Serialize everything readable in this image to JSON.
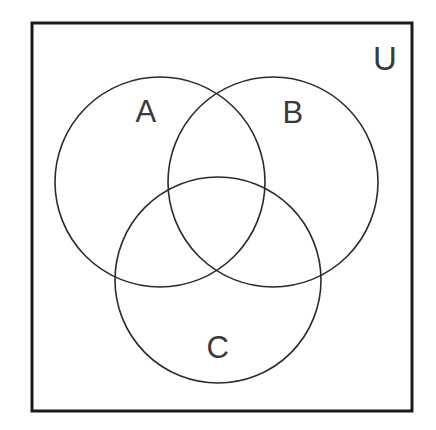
{
  "diagram": {
    "type": "venn-3-set",
    "canvas": {
      "width": 436,
      "height": 430,
      "background": "#ffffff"
    },
    "universe": {
      "label": "U",
      "label_name": "universal-set-label",
      "x": 32,
      "y": 23,
      "width": 380,
      "height": 388,
      "stroke": "#1a1a1a",
      "stroke_width": 3,
      "fill": "#ffffff",
      "label_x": 385,
      "label_y": 58
    },
    "sets": [
      {
        "label": "A",
        "name": "set-a",
        "cx": 160,
        "cy": 182,
        "r": 105,
        "label_x": 146,
        "label_y": 111,
        "stroke": "#2b2b2b",
        "stroke_width": 1.6,
        "fill": "none"
      },
      {
        "label": "B",
        "name": "set-b",
        "cx": 273,
        "cy": 182,
        "r": 105,
        "label_x": 293,
        "label_y": 112,
        "stroke": "#2b2b2b",
        "stroke_width": 1.6,
        "fill": "none"
      },
      {
        "label": "C",
        "name": "set-c",
        "cx": 218,
        "cy": 280,
        "r": 103,
        "label_x": 218,
        "label_y": 347,
        "stroke": "#2b2b2b",
        "stroke_width": 1.6,
        "fill": "none"
      }
    ],
    "colors": {
      "border": "#1a1a1a",
      "circle_stroke": "#2b2b2b",
      "text": "#3a3a3a",
      "background": "#ffffff"
    }
  }
}
